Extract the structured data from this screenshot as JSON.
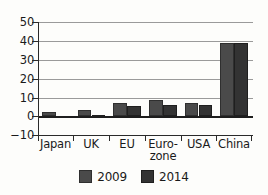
{
  "chart_data": {
    "type": "bar",
    "title": "",
    "subtitle": "",
    "xlabel": "",
    "ylabel": "",
    "categories": [
      "Japan",
      "UK",
      "EU",
      "Euro-\nzone",
      "USA",
      "China"
    ],
    "series": [
      {
        "name": "2009",
        "color": "#4a4a4a",
        "values": [
          2,
          3.5,
          7,
          8.5,
          7,
          39
        ]
      },
      {
        "name": "2014",
        "color": "#333333",
        "values": [
          -0.5,
          0.5,
          5.5,
          6,
          6,
          39
        ]
      }
    ],
    "ylim": [
      -10,
      50
    ],
    "yticks": [
      50,
      40,
      30,
      20,
      10,
      0,
      -10
    ],
    "ytick_labels": [
      "50",
      "40",
      "30",
      "20",
      "10",
      "0",
      "−10"
    ],
    "grid": true,
    "grid_axis": "y",
    "legend_position": "bottom"
  },
  "legend": {
    "items": [
      {
        "label": "2009",
        "color": "#4a4a4a"
      },
      {
        "label": "2014",
        "color": "#333333"
      }
    ]
  }
}
